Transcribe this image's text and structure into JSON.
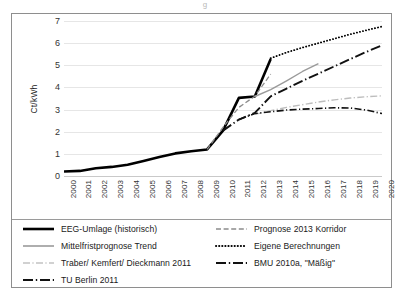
{
  "artifact_text": "g",
  "chart_data": {
    "type": "line",
    "title": "",
    "xlabel": "",
    "ylabel": "Ct/kWh",
    "xlim": [
      2000,
      2020
    ],
    "ylim": [
      0,
      7
    ],
    "yticks": [
      0,
      1,
      2,
      3,
      4,
      5,
      6,
      7
    ],
    "grid": true,
    "legend_position": "below",
    "categories": [
      2000,
      2001,
      2002,
      2003,
      2004,
      2005,
      2006,
      2007,
      2008,
      2009,
      2010,
      2011,
      2012,
      2013,
      2014,
      2015,
      2016,
      2017,
      2018,
      2019,
      2020
    ],
    "series": [
      {
        "name": "EEG-Umlage (historisch)",
        "style": "solid",
        "width": 2.6,
        "color": "#000000",
        "x": [
          2000,
          2001,
          2002,
          2003,
          2004,
          2005,
          2006,
          2007,
          2008,
          2009,
          2010,
          2011,
          2012,
          2013
        ],
        "values": [
          0.2,
          0.23,
          0.35,
          0.41,
          0.51,
          0.68,
          0.86,
          1.02,
          1.12,
          1.2,
          2.05,
          3.53,
          3.59,
          5.28
        ]
      },
      {
        "name": "Prognose 2013 Korridor",
        "style": "dashed",
        "width": 1.3,
        "color": "#8c8c8c",
        "x": [
          2009,
          2010,
          2011,
          2012,
          2013
        ],
        "values": [
          1.2,
          2.2,
          3.1,
          3.6,
          4.6
        ]
      },
      {
        "name": "Mittelfristprognose Trend",
        "style": "solid",
        "width": 1.4,
        "color": "#9a9a9a",
        "x": [
          2012,
          2013,
          2014,
          2015,
          2016
        ],
        "values": [
          3.59,
          3.9,
          4.3,
          4.72,
          5.08
        ]
      },
      {
        "name": "Eigene Berechnungen",
        "style": "dotted",
        "width": 1.8,
        "color": "#000000",
        "x": [
          2013,
          2014,
          2015,
          2016,
          2017,
          2018,
          2019,
          2020
        ],
        "values": [
          5.32,
          5.58,
          5.8,
          6.0,
          6.2,
          6.4,
          6.58,
          6.75
        ]
      },
      {
        "name": "Traber/ Kemfert/ Dieckmann 2011",
        "style": "dashdot",
        "width": 1.4,
        "color": "#bdbdbd",
        "x": [
          2012,
          2013,
          2014,
          2015,
          2016,
          2017,
          2018,
          2019,
          2020
        ],
        "values": [
          2.78,
          2.95,
          3.1,
          3.22,
          3.34,
          3.44,
          3.52,
          3.58,
          3.62
        ]
      },
      {
        "name": "BMU 2010a, \"Mäßig\"",
        "style": "dashdot",
        "width": 1.6,
        "color": "#111111",
        "x": [
          2011,
          2012,
          2013,
          2014,
          2015,
          2016,
          2017,
          2018,
          2019,
          2020
        ],
        "values": [
          2.55,
          2.82,
          2.9,
          2.98,
          3.02,
          3.05,
          3.08,
          3.07,
          2.98,
          2.82
        ]
      },
      {
        "name": "TU Berlin 2011",
        "style": "longdashdot",
        "width": 1.9,
        "color": "#111111",
        "x": [
          2010,
          2011,
          2012,
          2013,
          2014,
          2015,
          2016,
          2017,
          2018,
          2019,
          2020
        ],
        "values": [
          2.05,
          2.55,
          2.85,
          3.6,
          3.95,
          4.3,
          4.62,
          4.95,
          5.28,
          5.6,
          5.9
        ]
      }
    ]
  },
  "axes": {
    "y_title": "Ct/kWh",
    "y_ticks": [
      "7",
      "6",
      "5",
      "4",
      "3",
      "2",
      "1",
      "0"
    ],
    "x_ticks": [
      "2000",
      "2001",
      "2002",
      "2003",
      "2004",
      "2005",
      "2006",
      "2007",
      "2008",
      "2009",
      "2010",
      "2011",
      "2012",
      "2013",
      "2014",
      "2015",
      "2016",
      "2017",
      "2018",
      "2019",
      "2020"
    ]
  },
  "legend": {
    "left": [
      {
        "label": "EEG-Umlage (historisch)",
        "style": "solid",
        "color": "#000000",
        "width": 2.6
      },
      {
        "label": "Mittelfristprognose Trend",
        "style": "solid",
        "color": "#9a9a9a",
        "width": 1.6
      },
      {
        "label": "Traber/ Kemfert/ Dieckmann 2011",
        "style": "dashdot",
        "color": "#c2c2c2",
        "width": 1.6
      },
      {
        "label": "TU Berlin 2011",
        "style": "longdashdot",
        "color": "#111111",
        "width": 2.2
      }
    ],
    "right": [
      {
        "label": "Prognose 2013 Korridor",
        "style": "dashed",
        "color": "#8c8c8c",
        "width": 1.4
      },
      {
        "label": "Eigene Berechnungen",
        "style": "dotted",
        "color": "#000000",
        "width": 2.0
      },
      {
        "label": "BMU 2010a, \"Mäßig\"",
        "style": "longdashdot",
        "color": "#111111",
        "width": 2.2
      }
    ]
  }
}
